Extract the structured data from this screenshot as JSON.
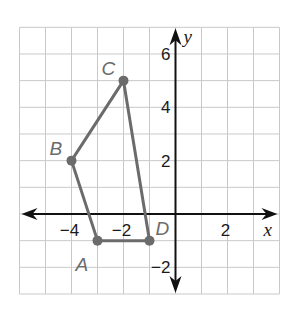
{
  "diagram": {
    "type": "coordinate-plane-polygon",
    "grid": {
      "x_min": -6,
      "x_max": 4,
      "y_min": -3,
      "y_max": 7,
      "step": 1,
      "color": "#c9c9c9"
    },
    "axes": {
      "x_label": "x",
      "y_label": "y",
      "color": "#111111",
      "x_ticks": [
        {
          "value": -4,
          "label": "−4"
        },
        {
          "value": -2,
          "label": "−2"
        },
        {
          "value": 2,
          "label": "2"
        }
      ],
      "y_ticks": [
        {
          "value": 6,
          "label": "6"
        },
        {
          "value": 4,
          "label": "4"
        },
        {
          "value": 2,
          "label": "2"
        },
        {
          "value": -2,
          "label": "−2"
        }
      ]
    },
    "polygon": {
      "color": "#6b6b6b",
      "order": [
        "A",
        "B",
        "C",
        "D"
      ],
      "vertices": [
        {
          "name": "A",
          "x": -3,
          "y": -1
        },
        {
          "name": "B",
          "x": -4,
          "y": 2
        },
        {
          "name": "C",
          "x": -2,
          "y": 5
        },
        {
          "name": "D",
          "x": -1,
          "y": -1
        }
      ]
    }
  }
}
